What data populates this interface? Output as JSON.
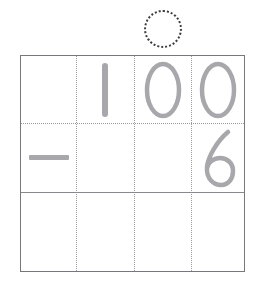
{
  "worksheet": {
    "title": "Vertical subtraction place-value grid",
    "problem": "100 - 6",
    "operator": "minus",
    "operator_symbol": "−",
    "regroup_hint": {
      "name": "dotted-circle",
      "over_column_index": 2,
      "style": "dotted",
      "color": "#3c3c3c"
    },
    "grid": {
      "columns": 4,
      "rows": 3,
      "outer_border_color": "#77787c",
      "dotted_line_color": "#9a9a9e",
      "solid_line_color": "#88898d",
      "digit_color": "#a8a8ac",
      "cells": [
        [
          {
            "name": "cell-r1-c1",
            "value": "",
            "type": "empty"
          },
          {
            "name": "cell-r1-c2",
            "value": "1",
            "type": "digit"
          },
          {
            "name": "cell-r1-c3",
            "value": "0",
            "type": "digit"
          },
          {
            "name": "cell-r1-c4",
            "value": "0",
            "type": "digit"
          }
        ],
        [
          {
            "name": "cell-r2-c1",
            "value": "−",
            "type": "operator"
          },
          {
            "name": "cell-r2-c2",
            "value": "",
            "type": "empty"
          },
          {
            "name": "cell-r2-c3",
            "value": "",
            "type": "empty"
          },
          {
            "name": "cell-r2-c4",
            "value": "6",
            "type": "digit"
          }
        ],
        [
          {
            "name": "cell-r3-c1",
            "value": "",
            "type": "empty"
          },
          {
            "name": "cell-r3-c2",
            "value": "",
            "type": "empty"
          },
          {
            "name": "cell-r3-c3",
            "value": "",
            "type": "empty"
          },
          {
            "name": "cell-r3-c4",
            "value": "",
            "type": "empty"
          }
        ]
      ]
    }
  }
}
